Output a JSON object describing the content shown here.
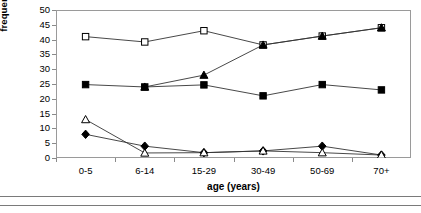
{
  "chart_data": {
    "type": "line",
    "title": "",
    "xlabel": "age (years)",
    "ylabel": "frequency of isolation (% )",
    "categories": [
      "0-5",
      "6-14",
      "15-29",
      "30-49",
      "50-69",
      "70+"
    ],
    "ylim": [
      0,
      50
    ],
    "yticks": [
      0,
      5,
      10,
      15,
      20,
      25,
      30,
      35,
      40,
      45,
      50
    ],
    "grid": false,
    "legend": "none",
    "series": [
      {
        "name": "open-square-series",
        "marker": "open-square",
        "values": [
          41,
          39.2,
          43,
          38.2,
          41.2,
          44
        ]
      },
      {
        "name": "filled-square-series",
        "marker": "filled-square",
        "values": [
          24.8,
          24,
          24.7,
          21,
          24.8,
          23
        ]
      },
      {
        "name": "filled-triangle-series",
        "marker": "filled-triangle",
        "values": [
          null,
          24,
          28,
          38.2,
          41.2,
          44
        ]
      },
      {
        "name": "filled-diamond-series",
        "marker": "filled-diamond",
        "values": [
          8,
          4,
          1.8,
          2.4,
          4,
          1
        ]
      },
      {
        "name": "open-triangle-series",
        "marker": "open-triangle",
        "values": [
          13,
          1.7,
          1.8,
          2.4,
          1.8,
          1
        ]
      }
    ]
  },
  "axis": {
    "ylabel": "frequency of isolation (% )",
    "xlabel": "age (years)",
    "yticks": [
      "0",
      "5",
      "10",
      "15",
      "20",
      "25",
      "30",
      "35",
      "40",
      "45",
      "50"
    ],
    "xticks": [
      "0-5",
      "6-14",
      "15-29",
      "30-49",
      "50-69",
      "70+"
    ]
  }
}
